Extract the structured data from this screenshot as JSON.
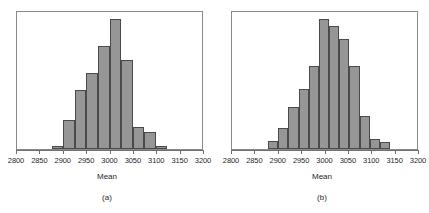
{
  "figure": {
    "background": "#ffffff",
    "bar_fill": "#969696",
    "bar_stroke": "#4a4a4a",
    "frame_color": "#8a8a8a"
  },
  "panels": [
    {
      "key": "a",
      "caption": "(a)",
      "axis_title": "Mean",
      "tick_labels": [
        "2800",
        "2850",
        "2900",
        "2950",
        "3000",
        "3050",
        "3100",
        "3150",
        "3200"
      ]
    },
    {
      "key": "b",
      "caption": "(b)",
      "axis_title": "Mean",
      "tick_labels": [
        "2800",
        "2850",
        "2900",
        "2950",
        "3000",
        "3050",
        "3100",
        "3150",
        "3200"
      ]
    }
  ],
  "chart_data": [
    {
      "type": "bar",
      "panel": "(a)",
      "title": "",
      "xlabel": "Mean",
      "ylabel": "",
      "xlim": [
        2800,
        3200
      ],
      "xticks": [
        2800,
        2850,
        2900,
        2950,
        3000,
        3050,
        3100,
        3150,
        3200
      ],
      "tick_labels": [
        "2800",
        "2850",
        "2900",
        "2950",
        "3000",
        "3050",
        "3100",
        "3150",
        "3200"
      ],
      "grid": false,
      "legend": "none",
      "bin_width": 25,
      "bin_edges": [
        2875,
        2900,
        2925,
        2950,
        2975,
        3000,
        3025,
        3050,
        3075,
        3100,
        3125
      ],
      "bin_centers": [
        2887.5,
        2912.5,
        2937.5,
        2962.5,
        2987.5,
        3012.5,
        3037.5,
        3062.5,
        3087.5,
        3112.5
      ],
      "values": [
        2,
        22,
        45,
        58,
        79,
        100,
        68,
        17,
        13,
        2
      ],
      "ylim": [
        0,
        105
      ],
      "y_units": "relative frequency (percent of peak)"
    },
    {
      "type": "bar",
      "panel": "(b)",
      "title": "",
      "xlabel": "Mean",
      "ylabel": "",
      "xlim": [
        2800,
        3200
      ],
      "xticks": [
        2800,
        2850,
        2900,
        2950,
        3000,
        3050,
        3100,
        3150,
        3200
      ],
      "tick_labels": [
        "2800",
        "2850",
        "2900",
        "2950",
        "3000",
        "3050",
        "3100",
        "3150",
        "3200"
      ],
      "grid": false,
      "legend": "none",
      "bin_width": 22,
      "bin_edges": [
        2878,
        2900,
        2922,
        2944,
        2966,
        2988,
        3010,
        3032,
        3054,
        3076,
        3098,
        3120,
        3142,
        3158
      ],
      "bin_centers": [
        2889,
        2911,
        2933,
        2955,
        2977,
        2999,
        3021,
        3043,
        3065,
        3087,
        3109,
        3131,
        3150
      ],
      "values": [
        6,
        16,
        32,
        46,
        64,
        100,
        94,
        84,
        64,
        25,
        8,
        5,
        0
      ],
      "ylim": [
        0,
        105
      ],
      "y_units": "relative frequency (percent of peak)"
    }
  ]
}
